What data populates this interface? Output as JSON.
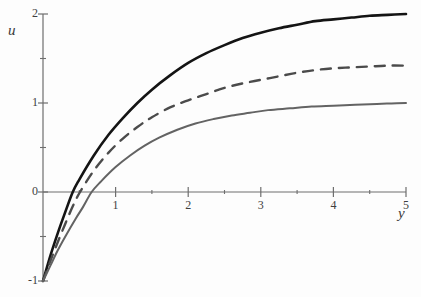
{
  "chart_data": {
    "type": "line",
    "title": "",
    "xlabel": "y",
    "ylabel": "u",
    "xlim": [
      0,
      5
    ],
    "ylim": [
      -1,
      2
    ],
    "grid": false,
    "legend": "none",
    "x_ticks_major": [
      1,
      2,
      3,
      4,
      5
    ],
    "x_ticks_minor": [
      0.5,
      1.5,
      2.5,
      3.5,
      4.5
    ],
    "y_ticks_major": [
      -1,
      0,
      1,
      2
    ],
    "y_ticks_minor": [
      -0.5,
      0.5,
      1.5
    ],
    "x_tick_labels": [
      "1",
      "2",
      "3",
      "4",
      "5"
    ],
    "y_tick_labels": [
      "2",
      "1",
      "0",
      "-1"
    ],
    "series": [
      {
        "name": "upper-curve",
        "style": "solid",
        "color": "#141414",
        "width": 2.6,
        "x": [
          0,
          0.1,
          0.2,
          0.3,
          0.41,
          0.5,
          0.7,
          0.9,
          1.1,
          1.3,
          1.5,
          1.75,
          2.0,
          2.25,
          2.5,
          2.75,
          3.0,
          3.25,
          3.5,
          3.75,
          4.0,
          4.25,
          4.5,
          4.75,
          5.0
        ],
        "values": [
          -1.0,
          -0.72,
          -0.47,
          -0.24,
          0.0,
          0.14,
          0.41,
          0.64,
          0.83,
          1.0,
          1.15,
          1.31,
          1.45,
          1.56,
          1.65,
          1.73,
          1.79,
          1.84,
          1.88,
          1.92,
          1.94,
          1.96,
          1.98,
          1.99,
          2.0
        ]
      },
      {
        "name": "middle-curve",
        "style": "dashed",
        "color": "#4b4b4b",
        "width": 2.4,
        "x": [
          0,
          0.1,
          0.2,
          0.3,
          0.41,
          0.51,
          0.7,
          0.9,
          1.1,
          1.3,
          1.5,
          1.75,
          2.0,
          2.25,
          2.5,
          2.75,
          3.0,
          3.25,
          3.5,
          3.75,
          4.0,
          4.25,
          4.5,
          4.75,
          5.0
        ],
        "values": [
          -1.0,
          -0.78,
          -0.57,
          -0.37,
          -0.16,
          0.0,
          0.24,
          0.44,
          0.6,
          0.73,
          0.84,
          0.95,
          1.03,
          1.1,
          1.17,
          1.22,
          1.26,
          1.3,
          1.34,
          1.37,
          1.39,
          1.4,
          1.41,
          1.42,
          1.42
        ]
      },
      {
        "name": "lower-curve",
        "style": "solid",
        "color": "#636363",
        "width": 2.0,
        "x": [
          0,
          0.1,
          0.2,
          0.3,
          0.45,
          0.55,
          0.67,
          0.8,
          1.0,
          1.2,
          1.4,
          1.6,
          1.85,
          2.1,
          2.35,
          2.6,
          2.85,
          3.1,
          3.4,
          3.7,
          4.0,
          4.3,
          4.6,
          4.8,
          5.0
        ],
        "values": [
          -1.0,
          -0.83,
          -0.66,
          -0.51,
          -0.3,
          -0.17,
          0.0,
          0.12,
          0.28,
          0.41,
          0.52,
          0.61,
          0.7,
          0.77,
          0.82,
          0.86,
          0.89,
          0.92,
          0.94,
          0.96,
          0.97,
          0.98,
          0.99,
          0.995,
          1.0
        ]
      }
    ]
  },
  "axes": {
    "x_axis_label": "y",
    "y_axis_label": "u"
  }
}
